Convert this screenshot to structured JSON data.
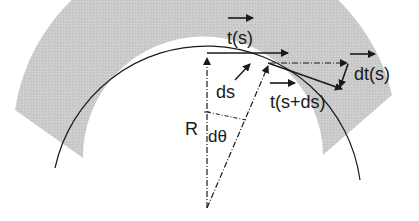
{
  "diagram": {
    "labels": {
      "t_s": "t(s)",
      "t_s_ds": "t(s+ds)",
      "dt_s": "dt(s)",
      "ds": "ds",
      "R": "R",
      "dtheta": "dθ"
    },
    "colors": {
      "band": "#c8c8c8",
      "ink": "#1a1a1a",
      "background": "#ffffff"
    }
  }
}
